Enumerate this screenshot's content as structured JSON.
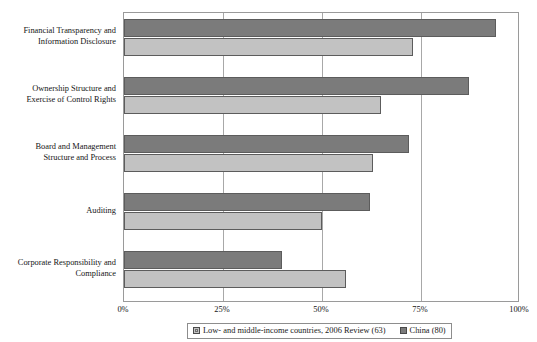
{
  "chart_data": {
    "type": "bar",
    "orientation": "horizontal",
    "title": "",
    "xlabel": "",
    "ylabel": "",
    "xlim": [
      0,
      100
    ],
    "xticks": [
      "0%",
      "25%",
      "50%",
      "75%",
      "100%"
    ],
    "xtick_values": [
      0,
      25,
      50,
      75,
      100
    ],
    "grid": true,
    "legend_position": "bottom",
    "categories": [
      "Financial Transparency and Information Disclosure",
      "Ownership Structure and Exercise of Control Rights",
      "Board and Management Structure and Process",
      "Auditing",
      "Corporate Responsibility and Compliance"
    ],
    "category_lines": [
      [
        "Financial Transparency and",
        "Information Disclosure"
      ],
      [
        "Ownership Structure and",
        "Exercise of Control Rights"
      ],
      [
        "Board and Management",
        "Structure and Process"
      ],
      [
        "Auditing"
      ],
      [
        "Corporate Responsibility and",
        "Compliance"
      ]
    ],
    "series": [
      {
        "name": "Low- and middle-income countries, 2006 Review (63)",
        "color": "#c2c2c2",
        "values": [
          73,
          65,
          63,
          50,
          56
        ]
      },
      {
        "name": "China (80)",
        "color": "#7b7b7b",
        "values": [
          94,
          87,
          72,
          62,
          40
        ]
      }
    ]
  },
  "legend": {
    "items": [
      {
        "label": "Low- and middle-income countries, 2006 Review (63)"
      },
      {
        "label": "China (80)"
      }
    ]
  },
  "title_remnant": ""
}
